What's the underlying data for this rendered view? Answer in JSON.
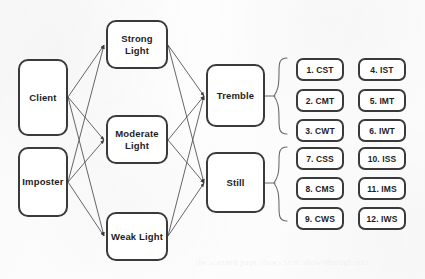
{
  "diagram": {
    "background_color": "#fdfdfd",
    "node_border_color": "#3a3a3a",
    "node_fill_color": "#ffffff",
    "edge_color": "#555555",
    "input_nodes": [
      {
        "id": "client",
        "label": "Client"
      },
      {
        "id": "imposter",
        "label": "Imposter"
      }
    ],
    "light_nodes": [
      {
        "id": "strong",
        "label": "Strong Light"
      },
      {
        "id": "moderate",
        "label": "Moderate Light"
      },
      {
        "id": "weak",
        "label": "Weak Light"
      }
    ],
    "state_nodes": [
      {
        "id": "tremble",
        "label": "Tremble"
      },
      {
        "id": "still",
        "label": "Still"
      }
    ],
    "tremble_group": {
      "column_left": [
        "1. CST",
        "2. CMT",
        "3. CWT"
      ],
      "column_right": [
        "4. IST",
        "5. IMT",
        "6. IWT"
      ]
    },
    "still_group": {
      "column_left": [
        "7. CSS",
        "8. CMS",
        "9. CWS"
      ],
      "column_right": [
        "10. ISS",
        "11. IMS",
        "12. IWS"
      ]
    },
    "ghost_watermark": "the scanned page shows faint show-through text"
  }
}
